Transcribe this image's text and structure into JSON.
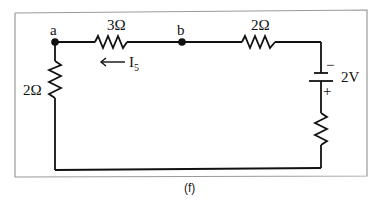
{
  "figure": {
    "caption": "(f)",
    "nodes": [
      {
        "id": "a",
        "label": "a"
      },
      {
        "id": "b",
        "label": "b"
      }
    ],
    "components": [
      {
        "type": "resistor",
        "label": "3Ω",
        "location": "top, between a and b"
      },
      {
        "type": "resistor",
        "label": "2Ω",
        "location": "top, right of b"
      },
      {
        "type": "resistor",
        "label": "2Ω",
        "location": "left branch below a"
      },
      {
        "type": "battery",
        "label": "2V",
        "neg": "−",
        "pos": "+",
        "location": "right branch"
      },
      {
        "type": "resistor",
        "label": "",
        "location": "right branch below battery"
      }
    ],
    "current": {
      "label": "I",
      "subscript": "5",
      "direction": "left"
    }
  },
  "labels": {
    "node_a": "a",
    "node_b": "b",
    "r_top_left": "3Ω",
    "r_top_right": "2Ω",
    "r_left": "2Ω",
    "battery_voltage": "2V",
    "battery_neg": "−",
    "battery_pos": "+",
    "current_main": "I",
    "current_sub": "5",
    "caption": "(f)"
  }
}
